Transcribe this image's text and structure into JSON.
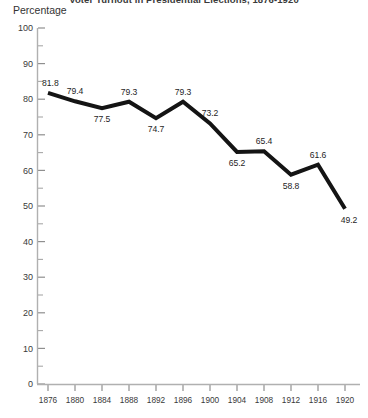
{
  "chart_data": {
    "type": "line",
    "title": "Voter Turnout in Presidential Elections, 1876-1920",
    "xlabel": "",
    "ylabel": "Percentage",
    "categories": [
      "1876",
      "1880",
      "1884",
      "1888",
      "1892",
      "1896",
      "1900",
      "1904",
      "1908",
      "1912",
      "1916",
      "1920"
    ],
    "values": [
      81.8,
      79.4,
      77.5,
      79.3,
      74.7,
      79.3,
      73.2,
      65.2,
      65.4,
      58.8,
      61.6,
      49.2
    ],
    "point_labels": [
      "81.8",
      "79.4",
      "77.5",
      "79.3",
      "74.7",
      "79.3",
      "73.2",
      "65.2",
      "65.4",
      "58.8",
      "61.6",
      "49.2"
    ],
    "label_positions": [
      "above",
      "above",
      "below",
      "above",
      "below",
      "above",
      "above",
      "below",
      "above",
      "below",
      "above",
      "below"
    ],
    "ylim": [
      0,
      100
    ],
    "y_ticks": [
      0,
      10,
      20,
      30,
      40,
      50,
      60,
      70,
      80,
      90,
      100
    ],
    "y_tick_labels": [
      "0",
      "10",
      "20",
      "30",
      "40",
      "50",
      "60",
      "70",
      "80",
      "90",
      "100"
    ],
    "y_minor_step": 5,
    "grid": false,
    "legend": "none",
    "series_color": "#141414",
    "axis_color": "#b0b0b0"
  }
}
